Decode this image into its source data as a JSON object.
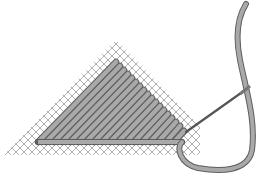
{
  "illustration": {
    "subject": "tent stitch on needlepoint canvas with threaded needle",
    "colors": {
      "background": "#ffffff",
      "canvas_mesh": "#9a9a9a",
      "thread_fill": "#a9a9a9",
      "thread_outline": "#5e5e5e",
      "needle": "#555555"
    }
  }
}
